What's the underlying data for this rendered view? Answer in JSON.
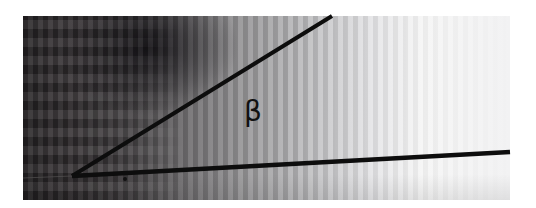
{
  "figure": {
    "angle_label": "β",
    "vertex": [
      72,
      176
    ],
    "upper_line_end": [
      332,
      16
    ],
    "lower_line_end": [
      510,
      152
    ],
    "line_color": "#0d0d0d"
  }
}
